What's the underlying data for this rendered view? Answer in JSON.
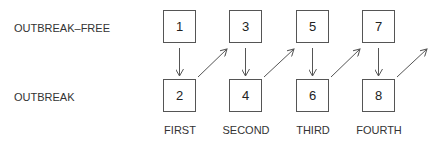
{
  "rows": {
    "top": "OUTBREAK–FREE",
    "bottom": "OUTBREAK"
  },
  "boxes": {
    "top": [
      "1",
      "3",
      "5",
      "7"
    ],
    "bottom": [
      "2",
      "4",
      "6",
      "8"
    ]
  },
  "columns": [
    "FIRST",
    "SECOND",
    "THIRD",
    "FOURTH"
  ],
  "arrows": [
    {
      "from": "1",
      "to": "2"
    },
    {
      "from": "2",
      "to": "3"
    },
    {
      "from": "3",
      "to": "4"
    },
    {
      "from": "4",
      "to": "5"
    },
    {
      "from": "5",
      "to": "6"
    },
    {
      "from": "6",
      "to": "7"
    },
    {
      "from": "7",
      "to": "8"
    },
    {
      "from": "8",
      "to": "next"
    }
  ]
}
